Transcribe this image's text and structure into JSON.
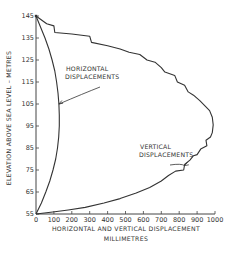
{
  "chart_data": {
    "type": "line",
    "title": "",
    "xlabel": "HORIZONTAL AND VERTICAL DISPLACEMENT",
    "xlabel_units": "MILLIMETRES",
    "ylabel": "ELEVATION ABOVE SEA LEVEL – METRES",
    "xlim": [
      0,
      1000
    ],
    "ylim": [
      55,
      145
    ],
    "x_ticks": [
      0,
      100,
      200,
      300,
      400,
      500,
      600,
      700,
      800,
      900,
      1000
    ],
    "x_tick_labels": [
      "0",
      "100",
      "200",
      "300",
      "400",
      "500",
      "600",
      "700",
      "800",
      "900",
      "1000"
    ],
    "y_ticks": [
      55,
      65,
      75,
      85,
      95,
      105,
      115,
      125,
      135,
      145
    ],
    "y_tick_labels": [
      "55",
      "65",
      "75",
      "85",
      "95",
      "105",
      "115",
      "125",
      "135",
      "145"
    ],
    "grid": false,
    "legend": "none",
    "series": [
      {
        "name": "HORIZONTAL DISPLACEMENTS",
        "points": [
          {
            "x": 0,
            "y": 145
          },
          {
            "x": 25,
            "y": 140
          },
          {
            "x": 50,
            "y": 135
          },
          {
            "x": 72,
            "y": 130
          },
          {
            "x": 90,
            "y": 125
          },
          {
            "x": 105,
            "y": 120
          },
          {
            "x": 115,
            "y": 115
          },
          {
            "x": 123,
            "y": 110
          },
          {
            "x": 128,
            "y": 105
          },
          {
            "x": 130,
            "y": 100
          },
          {
            "x": 130,
            "y": 95
          },
          {
            "x": 127,
            "y": 90
          },
          {
            "x": 120,
            "y": 85
          },
          {
            "x": 110,
            "y": 80
          },
          {
            "x": 95,
            "y": 75
          },
          {
            "x": 77,
            "y": 70
          },
          {
            "x": 55,
            "y": 65
          },
          {
            "x": 30,
            "y": 60
          },
          {
            "x": 0,
            "y": 55
          }
        ]
      },
      {
        "name": "VERTICAL DISPLACEMENTS",
        "points": [
          {
            "x": 0,
            "y": 145
          },
          {
            "x": 60,
            "y": 141.5
          },
          {
            "x": 100,
            "y": 140.5
          },
          {
            "x": 105,
            "y": 137.5
          },
          {
            "x": 200,
            "y": 136.8
          },
          {
            "x": 300,
            "y": 135.8
          },
          {
            "x": 310,
            "y": 133
          },
          {
            "x": 400,
            "y": 131.5
          },
          {
            "x": 470,
            "y": 130
          },
          {
            "x": 520,
            "y": 128.5
          },
          {
            "x": 580,
            "y": 127.5
          },
          {
            "x": 620,
            "y": 125
          },
          {
            "x": 665,
            "y": 124
          },
          {
            "x": 700,
            "y": 121.5
          },
          {
            "x": 720,
            "y": 119.5
          },
          {
            "x": 775,
            "y": 118
          },
          {
            "x": 790,
            "y": 115
          },
          {
            "x": 830,
            "y": 113.5
          },
          {
            "x": 850,
            "y": 110.5
          },
          {
            "x": 880,
            "y": 109
          },
          {
            "x": 915,
            "y": 106.5
          },
          {
            "x": 945,
            "y": 104
          },
          {
            "x": 970,
            "y": 102
          },
          {
            "x": 985,
            "y": 99
          },
          {
            "x": 990,
            "y": 95.5
          },
          {
            "x": 985,
            "y": 92
          },
          {
            "x": 975,
            "y": 90
          },
          {
            "x": 950,
            "y": 88.5
          },
          {
            "x": 955,
            "y": 86
          },
          {
            "x": 920,
            "y": 84.5
          },
          {
            "x": 900,
            "y": 82
          },
          {
            "x": 880,
            "y": 81.5
          },
          {
            "x": 860,
            "y": 79.5
          },
          {
            "x": 830,
            "y": 77.5
          },
          {
            "x": 825,
            "y": 75
          },
          {
            "x": 780,
            "y": 74.5
          },
          {
            "x": 740,
            "y": 72.5
          },
          {
            "x": 700,
            "y": 70
          },
          {
            "x": 635,
            "y": 67
          },
          {
            "x": 560,
            "y": 64.5
          },
          {
            "x": 470,
            "y": 62
          },
          {
            "x": 380,
            "y": 60
          },
          {
            "x": 275,
            "y": 58
          },
          {
            "x": 180,
            "y": 56.8
          },
          {
            "x": 105,
            "y": 56
          },
          {
            "x": 0,
            "y": 55
          }
        ]
      }
    ],
    "annotations": [
      {
        "text_lines": [
          "HORIZONTAL",
          "DISPLACEMENTS"
        ],
        "points_to": {
          "x": 128,
          "y": 105
        }
      },
      {
        "text_lines": [
          "VERTICAL",
          "DISPLACEMENTS"
        ],
        "points_to": {
          "x": 830,
          "y": 77
        }
      }
    ]
  }
}
